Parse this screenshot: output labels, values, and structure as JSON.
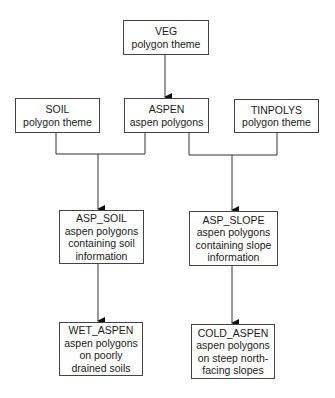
{
  "diagram": {
    "type": "flowchart",
    "nodes": [
      {
        "id": "veg",
        "title": "VEG",
        "lines": [
          "polygon theme"
        ]
      },
      {
        "id": "soil",
        "title": "SOIL",
        "lines": [
          "polygon theme"
        ]
      },
      {
        "id": "aspen",
        "title": "ASPEN",
        "lines": [
          "aspen polygons"
        ]
      },
      {
        "id": "tinpolys",
        "title": "TINPOLYS",
        "lines": [
          "polygon theme"
        ]
      },
      {
        "id": "asp_soil",
        "title": "ASP_SOIL",
        "lines": [
          "aspen polygons",
          "containing soil",
          "information"
        ]
      },
      {
        "id": "asp_slope",
        "title": "ASP_SLOPE",
        "lines": [
          "aspen polygons",
          "containing slope",
          "information"
        ]
      },
      {
        "id": "wet_aspen",
        "title": "WET_ASPEN",
        "lines": [
          "aspen polygons",
          "on poorly",
          "drained soils"
        ]
      },
      {
        "id": "cold_aspen",
        "title": "COLD_ASPEN",
        "lines": [
          "aspen polygons",
          "on steep north-",
          "facing slopes"
        ]
      }
    ],
    "edges": [
      {
        "from": "veg",
        "to": "aspen"
      },
      {
        "from": [
          "soil",
          "aspen"
        ],
        "to": "asp_soil"
      },
      {
        "from": [
          "aspen",
          "tinpolys"
        ],
        "to": "asp_slope"
      },
      {
        "from": "asp_soil",
        "to": "wet_aspen"
      },
      {
        "from": "asp_slope",
        "to": "cold_aspen"
      }
    ]
  }
}
